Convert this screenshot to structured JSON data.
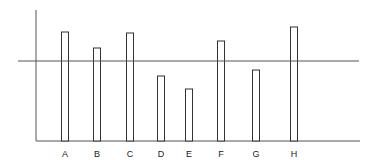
{
  "chart_data": {
    "type": "bar",
    "title": "",
    "xlabel": "",
    "ylabel": "",
    "categories": [
      "A",
      "B",
      "C",
      "D",
      "E",
      "F",
      "G",
      "H"
    ],
    "values": [
      109,
      93,
      108,
      65,
      52,
      100,
      71,
      114
    ],
    "reference_line": 80,
    "ylim": [
      0,
      131
    ],
    "grid": false,
    "legend": null,
    "bar_style": "outlined",
    "colors": {
      "stroke": "#333333",
      "fill": "#ffffff"
    }
  }
}
